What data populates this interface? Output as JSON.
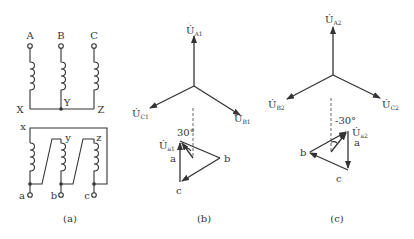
{
  "panel_a": {
    "primary_terminals": [
      "A",
      "B",
      "C"
    ],
    "primary_ends": [
      "X",
      "Y",
      "Z"
    ],
    "secondary_tops": [
      "x",
      "y",
      "z"
    ],
    "secondary_terminals": [
      "a",
      "b",
      "c"
    ],
    "caption": "(a)"
  },
  "panel_b": {
    "star": {
      "up": "U",
      "up_sub": "A1",
      "left": "U",
      "left_sub": "C1",
      "right": "U",
      "right_sub": "B1"
    },
    "angle": "30°",
    "vector": "U",
    "vector_sub": "a1",
    "vertices": {
      "a": "a",
      "b": "b",
      "c": "c"
    },
    "caption": "(b)"
  },
  "panel_c": {
    "star": {
      "up": "U",
      "up_sub": "A2",
      "left": "U",
      "left_sub": "B2",
      "right": "U",
      "right_sub": "C2"
    },
    "angle": "-30°",
    "vector": "U",
    "vector_sub": "a2",
    "vertices": {
      "a": "a",
      "b": "b",
      "c": "c"
    },
    "caption": "(c)"
  },
  "colors": {
    "ink": "#333333",
    "background": "#ffffff"
  }
}
